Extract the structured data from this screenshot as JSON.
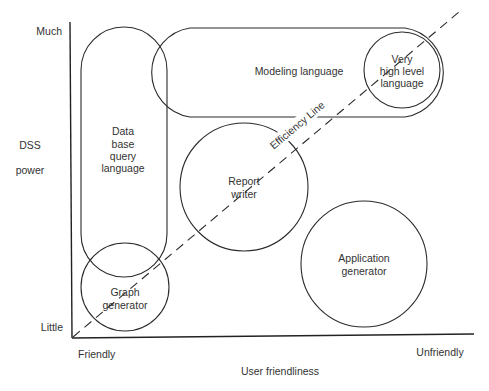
{
  "axes": {
    "y_label_line1": "DSS",
    "y_label_line2": "power",
    "y_top": "Much",
    "y_bottom": "Little",
    "x_label": "User friendliness",
    "x_left": "Friendly",
    "x_right": "Unfriendly"
  },
  "efficiency_line": {
    "label": "Efficiency Line"
  },
  "nodes": {
    "database_query_language": {
      "lines": [
        "Data",
        "base",
        "query",
        "language"
      ]
    },
    "modeling_language": {
      "lines": [
        "Modeling language"
      ]
    },
    "very_high_level_language": {
      "lines": [
        "Very",
        "high level",
        "language"
      ]
    },
    "report_writer": {
      "lines": [
        "Report",
        "writer"
      ]
    },
    "graph_generator": {
      "lines": [
        "Graph",
        "generator"
      ]
    },
    "application_generator": {
      "lines": [
        "Application",
        "generator"
      ]
    }
  },
  "colors": {
    "ink": "#2b2b2b",
    "background": "#ffffff"
  }
}
